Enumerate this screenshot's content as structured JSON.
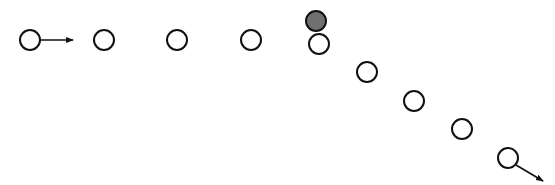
{
  "diagram": {
    "width": 555,
    "height": 185,
    "stroke_color": "#111111",
    "fill_color": "#ffffff",
    "highlight_fill": "#707070",
    "radius": 10,
    "circles": [
      {
        "cx": 30,
        "cy": 40,
        "filled": false
      },
      {
        "cx": 104,
        "cy": 40,
        "filled": false
      },
      {
        "cx": 177,
        "cy": 40,
        "filled": false
      },
      {
        "cx": 251,
        "cy": 40,
        "filled": false
      },
      {
        "cx": 319,
        "cy": 44,
        "filled": false
      },
      {
        "cx": 367,
        "cy": 72,
        "filled": false
      },
      {
        "cx": 414,
        "cy": 101,
        "filled": false
      },
      {
        "cx": 462,
        "cy": 129,
        "filled": false
      },
      {
        "cx": 508,
        "cy": 158,
        "filled": false
      },
      {
        "cx": 316,
        "cy": 21,
        "filled": true
      }
    ],
    "arrows": [
      {
        "x1": 40,
        "y1": 40,
        "x2": 73,
        "y2": 40
      },
      {
        "x1": 516,
        "y1": 165,
        "x2": 543,
        "y2": 181
      }
    ]
  }
}
